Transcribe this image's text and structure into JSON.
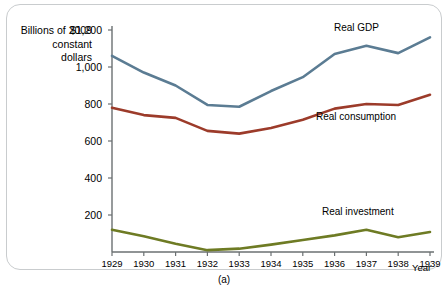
{
  "figure": {
    "caption": "(a)",
    "y_axis_title": "Billions of 2009 constant dollars"
  },
  "colors": {
    "gdp": "#5b7c93",
    "consumption": "#9c3b2a",
    "investment": "#6e7b24",
    "axis": "#6b7072",
    "frame": "#c9ccce"
  },
  "chart_data": {
    "type": "line",
    "title": "",
    "xlabel": "Year",
    "ylabel": "Billions of 2009 constant dollars",
    "xlim": [
      1929,
      1939
    ],
    "ylim": [
      0,
      1200
    ],
    "yticks": [
      200,
      400,
      600,
      800,
      1000,
      1200
    ],
    "ytick_labels": [
      "200",
      "400",
      "600",
      "800",
      "1,000",
      "$1,200"
    ],
    "categories": [
      1929,
      1930,
      1931,
      1932,
      1933,
      1934,
      1935,
      1936,
      1937,
      1938,
      1939
    ],
    "xtick_labels": [
      "1929",
      "1930",
      "1931",
      "1932",
      "1933",
      "1934",
      "1935",
      "1936",
      "1937",
      "1938",
      "1939"
    ],
    "grid": false,
    "legend": "inline-labels",
    "series": [
      {
        "name": "Real GDP",
        "color": "#5b7c93",
        "label_position": "upper-right",
        "values": [
          1060,
          970,
          900,
          795,
          785,
          870,
          945,
          1070,
          1115,
          1075,
          1160
        ]
      },
      {
        "name": "Real consumption",
        "color": "#9c3b2a",
        "label_position": "middle-right",
        "values": [
          780,
          740,
          725,
          655,
          640,
          670,
          715,
          775,
          800,
          795,
          850
        ]
      },
      {
        "name": "Real investment",
        "color": "#6e7b24",
        "label_position": "lower-right",
        "values": [
          120,
          85,
          45,
          10,
          18,
          40,
          65,
          90,
          120,
          80,
          108
        ]
      }
    ]
  }
}
